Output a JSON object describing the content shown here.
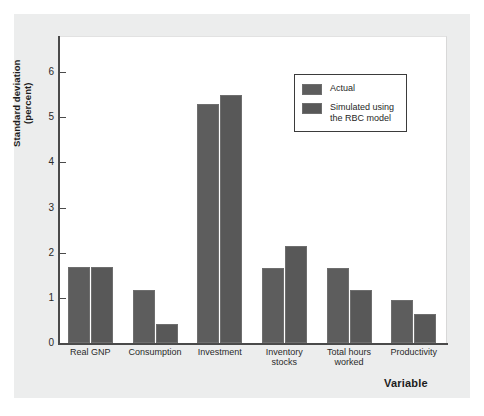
{
  "figure": {
    "axis_color": "#4a4a4a",
    "bar_color_actual": "#5d5d5d",
    "bar_color_simulated": "#585858",
    "panel_color": "#eceded",
    "plot_background": "#ffffff"
  },
  "labels": {
    "y_axis_title": "Standard deviation\n(percent)",
    "x_axis_title": "Variable"
  },
  "chart_data": {
    "type": "bar",
    "title": "",
    "xlabel": "Variable",
    "ylabel": "Standard deviation (percent)",
    "ylim": [
      0,
      6.8
    ],
    "yticks": [
      0,
      1,
      2,
      3,
      4,
      5,
      6
    ],
    "ytick_labels": [
      "0",
      "1",
      "2",
      "3",
      "4",
      "5",
      "6"
    ],
    "grid": false,
    "legend_position": "upper right",
    "categories": [
      "Real GNP",
      "Consumption",
      "Investment",
      "Inventory\nstocks",
      "Total hours\nworked",
      "Productivity"
    ],
    "series": [
      {
        "name": "Actual",
        "values": [
          1.69,
          1.17,
          5.3,
          1.67,
          1.67,
          0.95
        ]
      },
      {
        "name": "Simulated using\nthe RBC model",
        "values": [
          1.69,
          0.41,
          5.5,
          2.15,
          1.17,
          0.65
        ]
      }
    ]
  },
  "legend": {
    "items": [
      {
        "label": "Actual",
        "swatch": "#5d5d5d"
      },
      {
        "label": "Simulated using\nthe RBC model",
        "swatch": "#585858"
      }
    ]
  }
}
